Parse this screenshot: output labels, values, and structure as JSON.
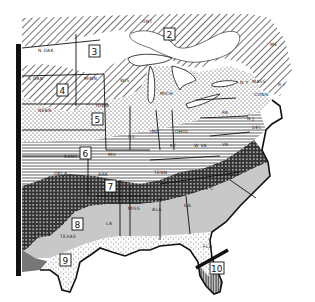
{
  "map": {
    "title": "",
    "zones": [
      {
        "id": "1",
        "label": "1",
        "pattern": "unmarked"
      },
      {
        "id": "2",
        "label": "2",
        "pattern": "diagonal-hatch"
      },
      {
        "id": "3",
        "label": "3",
        "pattern": "white"
      },
      {
        "id": "4",
        "label": "4",
        "pattern": "diagonal-hatch"
      },
      {
        "id": "5",
        "label": "5",
        "pattern": "dots"
      },
      {
        "id": "6",
        "label": "6",
        "pattern": "horizontal-lines"
      },
      {
        "id": "7",
        "label": "7",
        "pattern": "crosshatch-dark"
      },
      {
        "id": "8",
        "label": "8",
        "pattern": "gray-shade"
      },
      {
        "id": "9",
        "label": "9",
        "pattern": "light-dots"
      },
      {
        "id": "10",
        "label": "10",
        "pattern": "vertical-lines"
      }
    ],
    "state_labels": {
      "ont": "ONT",
      "ndak": "N DAK",
      "sdak": "S DAK",
      "nebr": "NEBR",
      "kans": "KANS",
      "okla": "OKLA",
      "texas": "TEXAS",
      "minn": "MINN",
      "iowa": "IOWA",
      "mo": "MO",
      "ark": "ARK",
      "la": "LA",
      "wis": "WIS",
      "ill": "ILL",
      "mich": "MICH",
      "ind": "IND",
      "ohio": "OHIO",
      "ky": "KY",
      "tenn": "TENN",
      "miss": "MISS",
      "ala": "ALA",
      "ga": "GA",
      "fla": "FLA",
      "sc": "S C",
      "nc": "N C",
      "va": "VA",
      "wva": "W VA",
      "pa": "PA",
      "nj": "N J",
      "del": "DEL",
      "ny": "N Y",
      "conn": "CONN",
      "mass": "MASS",
      "ri": "R I",
      "me": "ME"
    }
  }
}
